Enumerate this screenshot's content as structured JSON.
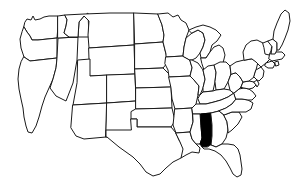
{
  "figure": {
    "kind": "choropleth-locator-map",
    "background_color": "#ffffff",
    "outline_color": "#1a1a1a",
    "default_state_fill": "#ffffff",
    "highlight_fill": "#000000",
    "projection_region": "contiguous-united-states",
    "width": 292,
    "height": 190
  },
  "highlight": {
    "state_name": "Alabama",
    "state_code": "AL",
    "fill": "#000000",
    "count": 1
  },
  "states": [
    {
      "code": "WA",
      "name": "Washington",
      "highlighted": false
    },
    {
      "code": "OR",
      "name": "Oregon",
      "highlighted": false
    },
    {
      "code": "CA",
      "name": "California",
      "highlighted": false
    },
    {
      "code": "NV",
      "name": "Nevada",
      "highlighted": false
    },
    {
      "code": "ID",
      "name": "Idaho",
      "highlighted": false
    },
    {
      "code": "MT",
      "name": "Montana",
      "highlighted": false
    },
    {
      "code": "WY",
      "name": "Wyoming",
      "highlighted": false
    },
    {
      "code": "UT",
      "name": "Utah",
      "highlighted": false
    },
    {
      "code": "AZ",
      "name": "Arizona",
      "highlighted": false
    },
    {
      "code": "CO",
      "name": "Colorado",
      "highlighted": false
    },
    {
      "code": "NM",
      "name": "New Mexico",
      "highlighted": false
    },
    {
      "code": "ND",
      "name": "North Dakota",
      "highlighted": false
    },
    {
      "code": "SD",
      "name": "South Dakota",
      "highlighted": false
    },
    {
      "code": "NE",
      "name": "Nebraska",
      "highlighted": false
    },
    {
      "code": "KS",
      "name": "Kansas",
      "highlighted": false
    },
    {
      "code": "OK",
      "name": "Oklahoma",
      "highlighted": false
    },
    {
      "code": "TX",
      "name": "Texas",
      "highlighted": false
    },
    {
      "code": "MN",
      "name": "Minnesota",
      "highlighted": false
    },
    {
      "code": "IA",
      "name": "Iowa",
      "highlighted": false
    },
    {
      "code": "MO",
      "name": "Missouri",
      "highlighted": false
    },
    {
      "code": "AR",
      "name": "Arkansas",
      "highlighted": false
    },
    {
      "code": "LA",
      "name": "Louisiana",
      "highlighted": false
    },
    {
      "code": "WI",
      "name": "Wisconsin",
      "highlighted": false
    },
    {
      "code": "IL",
      "name": "Illinois",
      "highlighted": false
    },
    {
      "code": "MI",
      "name": "Michigan",
      "highlighted": false
    },
    {
      "code": "IN",
      "name": "Indiana",
      "highlighted": false
    },
    {
      "code": "OH",
      "name": "Ohio",
      "highlighted": false
    },
    {
      "code": "KY",
      "name": "Kentucky",
      "highlighted": false
    },
    {
      "code": "TN",
      "name": "Tennessee",
      "highlighted": false
    },
    {
      "code": "MS",
      "name": "Mississippi",
      "highlighted": false
    },
    {
      "code": "AL",
      "name": "Alabama",
      "highlighted": true
    },
    {
      "code": "GA",
      "name": "Georgia",
      "highlighted": false
    },
    {
      "code": "FL",
      "name": "Florida",
      "highlighted": false
    },
    {
      "code": "SC",
      "name": "South Carolina",
      "highlighted": false
    },
    {
      "code": "NC",
      "name": "North Carolina",
      "highlighted": false
    },
    {
      "code": "VA",
      "name": "Virginia",
      "highlighted": false
    },
    {
      "code": "WV",
      "name": "West Virginia",
      "highlighted": false
    },
    {
      "code": "MD",
      "name": "Maryland",
      "highlighted": false
    },
    {
      "code": "DE",
      "name": "Delaware",
      "highlighted": false
    },
    {
      "code": "PA",
      "name": "Pennsylvania",
      "highlighted": false
    },
    {
      "code": "NJ",
      "name": "New Jersey",
      "highlighted": false
    },
    {
      "code": "NY",
      "name": "New York",
      "highlighted": false
    },
    {
      "code": "CT",
      "name": "Connecticut",
      "highlighted": false
    },
    {
      "code": "RI",
      "name": "Rhode Island",
      "highlighted": false
    },
    {
      "code": "MA",
      "name": "Massachusetts",
      "highlighted": false
    },
    {
      "code": "VT",
      "name": "Vermont",
      "highlighted": false
    },
    {
      "code": "NH",
      "name": "New Hampshire",
      "highlighted": false
    },
    {
      "code": "ME",
      "name": "Maine",
      "highlighted": false
    }
  ]
}
